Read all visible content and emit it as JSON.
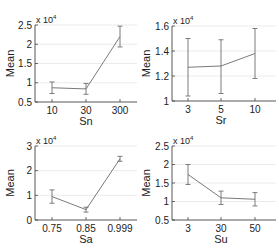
{
  "chart_data": [
    {
      "type": "line",
      "title": "",
      "xlabel": "Sn",
      "ylabel": "Mean",
      "scale_note": "x 10^4",
      "categories": [
        "10",
        "30",
        "300"
      ],
      "values": [
        0.87,
        0.84,
        2.2
      ],
      "error_low": [
        0.72,
        0.7,
        1.93
      ],
      "error_high": [
        1.02,
        0.98,
        2.47
      ],
      "yticks": [
        "0.5",
        "1",
        "1.5",
        "2",
        "2.5"
      ],
      "ylim": [
        0.5,
        2.5
      ],
      "grid": true,
      "geom": {
        "x0": 35,
        "x1": 137,
        "ytop": 25,
        "ybot": 102,
        "px": [
          52,
          86,
          120
        ],
        "labelx": 86,
        "ylabx": 14
      }
    },
    {
      "type": "line",
      "title": "",
      "xlabel": "Sr",
      "ylabel": "Mean",
      "scale_note": "x 10^4",
      "categories": [
        "3",
        "5",
        "10"
      ],
      "values": [
        1.27,
        1.28,
        1.38
      ],
      "error_low": [
        1.04,
        1.06,
        1.18
      ],
      "error_high": [
        1.5,
        1.49,
        1.58
      ],
      "yticks": [
        "1",
        "1.2",
        "1.4",
        "1.6"
      ],
      "ylim": [
        1.0,
        1.6
      ],
      "grid": true,
      "geom": {
        "x0": 172,
        "x1": 276,
        "ytop": 26,
        "ybot": 101,
        "px": [
          188,
          221,
          255
        ],
        "labelx": 221,
        "ylabx": 150
      }
    },
    {
      "type": "line",
      "title": "",
      "xlabel": "Sa",
      "ylabel": "Mean",
      "scale_note": "x 10^4",
      "categories": [
        "0.75",
        "0.85",
        "0.999"
      ],
      "values": [
        0.95,
        0.42,
        2.48
      ],
      "error_low": [
        0.68,
        0.32,
        2.38
      ],
      "error_high": [
        1.22,
        0.52,
        2.58
      ],
      "yticks": [
        "0",
        "1",
        "2",
        "3"
      ],
      "ylim": [
        0,
        3
      ],
      "grid": true,
      "geom": {
        "x0": 35,
        "x1": 137,
        "ytop": 146,
        "ybot": 220,
        "px": [
          52,
          86,
          120
        ],
        "labelx": 86,
        "ylabx": 14
      }
    },
    {
      "type": "line",
      "title": "",
      "xlabel": "Su",
      "ylabel": "Mean",
      "scale_note": "x 10^4",
      "categories": [
        "3",
        "30",
        "50"
      ],
      "values": [
        1.73,
        1.1,
        1.06
      ],
      "error_low": [
        1.46,
        0.92,
        0.88
      ],
      "error_high": [
        2.0,
        1.28,
        1.24
      ],
      "yticks": [
        "0.5",
        "1",
        "1.5",
        "2",
        "2.5"
      ],
      "ylim": [
        0.5,
        2.5
      ],
      "grid": true,
      "geom": {
        "x0": 172,
        "x1": 276,
        "ytop": 146,
        "ybot": 220,
        "px": [
          188,
          221,
          255
        ],
        "labelx": 221,
        "ylabx": 150
      }
    }
  ],
  "style": {
    "line_color": "#7a7a7a",
    "error_color": "#6e6e6e",
    "axis_color": "#444444",
    "grid_color": "#e6e6e6"
  }
}
